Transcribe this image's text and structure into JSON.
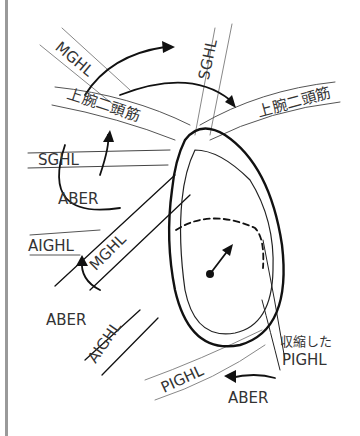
{
  "diagram": {
    "labels": {
      "mghl_top": "MGHL",
      "sghl_top": "SGHL",
      "biceps_left": "上腕二頭筋",
      "biceps_right": "上腕二頭筋",
      "sghl_left": "SGHL",
      "aber_upper": "ABER",
      "aighl_left": "AIGHL",
      "mghl_diag": "MGHL",
      "aber_mid": "ABER",
      "aighl_diag": "AIGHL",
      "contracted": "収縮した",
      "pighl_right": "PIGHL",
      "pighl_bottom": "PIGHL",
      "aber_bottom": "ABER"
    },
    "colors": {
      "line": "#111111",
      "ligament": "#888888",
      "text": "#333333",
      "border": "#9a9a9a"
    }
  }
}
